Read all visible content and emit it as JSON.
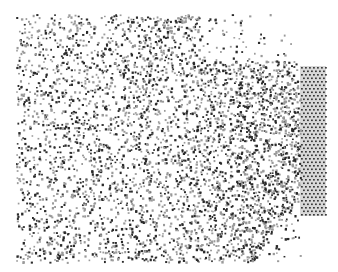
{
  "figure": {
    "background": "#ffffff",
    "width": 338,
    "height": 272
  },
  "particle_cloud": {
    "x_min": 16,
    "x_max": 300,
    "y_min": 14,
    "y_max": 262,
    "count": 4200,
    "dark_color": "#2a2a2a",
    "grey_color": "#9a9a9a",
    "dark_fraction": 0.45,
    "density_gradient": "increases toward lattice on right",
    "top_right_sparse": true
  },
  "lattice_block": {
    "x": 300,
    "y": 66,
    "width": 26,
    "height": 150,
    "spacing_x": 4,
    "spacing_y": 3.5,
    "color": "#3a3a3a",
    "fill": "#d8d8d8"
  }
}
